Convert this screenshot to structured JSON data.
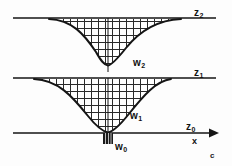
{
  "figure": {
    "caption_corner": "c",
    "stroke_color": "#151515",
    "hatch_color": "#2a2a2a",
    "background": "#fdfdfd"
  },
  "labels": {
    "z2": {
      "base": "z",
      "sub": "2"
    },
    "z1": {
      "base": "z",
      "sub": "1"
    },
    "z0": {
      "base": "z",
      "sub": "0"
    },
    "w2": {
      "base": "w",
      "sub": "2"
    },
    "w1": {
      "base": "w",
      "sub": "1"
    },
    "w0": {
      "base": "w",
      "sub": "0"
    },
    "x_axis": "x"
  },
  "geometry": {
    "plane_z2_y": 18,
    "plane_z1_y": 78,
    "plane_z0_y": 133,
    "plane_x_start": 13,
    "plane_x_end": 216,
    "axis_center_x": 110,
    "waist_x": 108,
    "waist_rect": {
      "x": 103,
      "y": 133,
      "w": 10,
      "h": 11
    },
    "upper_beam": {
      "left_edge": 49,
      "right_edge": 181,
      "bottom_y": 66,
      "half_width_at_bottom": 22
    },
    "lower_beam": {
      "left_edge": 34,
      "right_edge": 171,
      "bottom_y": 133,
      "half_width_at_bottom": 5
    }
  },
  "hatch": {
    "pattern": "square-grid",
    "spacing_px": 7
  }
}
